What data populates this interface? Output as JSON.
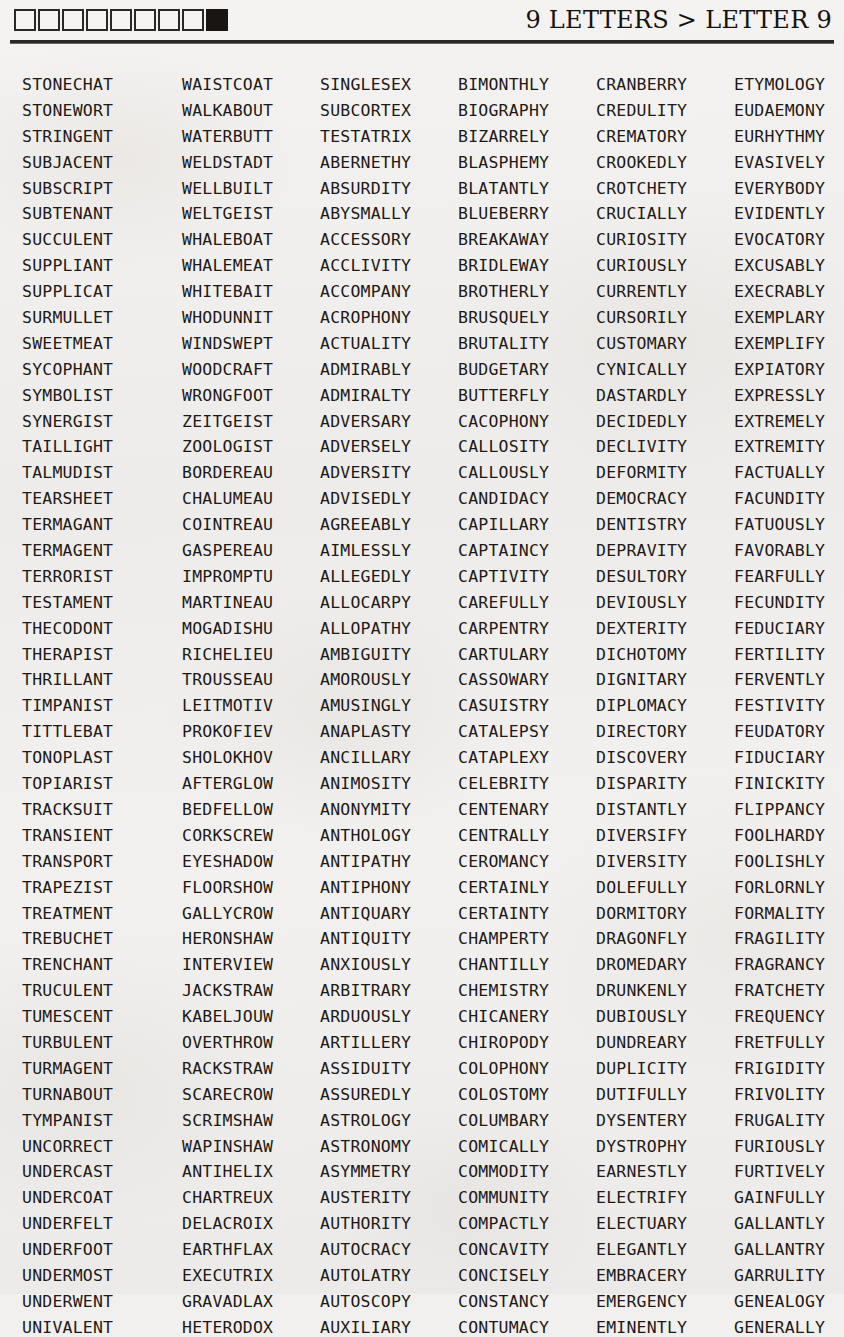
{
  "header": {
    "title": "9 LETTERS > LETTER 9",
    "boxes": [
      {
        "state": "empty"
      },
      {
        "state": "empty"
      },
      {
        "state": "empty"
      },
      {
        "state": "empty"
      },
      {
        "state": "empty"
      },
      {
        "state": "empty"
      },
      {
        "state": "empty"
      },
      {
        "state": "empty"
      },
      {
        "state": "filled"
      }
    ]
  },
  "word_grid": {
    "columns": [
      {
        "index": 1,
        "words": [
          "STONECHAT",
          "STONEWORT",
          "STRINGENT",
          "SUBJACENT",
          "SUBSCRIPT",
          "SUBTENANT",
          "SUCCULENT",
          "SUPPLIANT",
          "SUPPLICAT",
          "SURMULLET",
          "SWEETMEAT",
          "SYCOPHANT",
          "SYMBOLIST",
          "SYNERGIST",
          "TAILLIGHT",
          "TALMUDIST",
          "TEARSHEET",
          "TERMAGANT",
          "TERMAGENT",
          "TERRORIST",
          "TESTAMENT",
          "THECODONT",
          "THERAPIST",
          "THRILLANT",
          "TIMPANIST",
          "TITTLEBAT",
          "TONOPLAST",
          "TOPIARIST",
          "TRACKSUIT",
          "TRANSIENT",
          "TRANSPORT",
          "TRAPEZIST",
          "TREATMENT",
          "TREBUCHET",
          "TRENCHANT",
          "TRUCULENT",
          "TUMESCENT",
          "TURBULENT",
          "TURMAGENT",
          "TURNABOUT",
          "TYMPANIST",
          "UNCORRECT",
          "UNDERCAST",
          "UNDERCOAT",
          "UNDERFELT",
          "UNDERFOOT",
          "UNDERMOST",
          "UNDERWENT",
          "UNIVALENT"
        ]
      },
      {
        "index": 2,
        "words": [
          "WAISTCOAT",
          "WALKABOUT",
          "WATERBUTT",
          "WELDSTADT",
          "WELLBUILT",
          "WELTGEIST",
          "WHALEBOAT",
          "WHALEMEAT",
          "WHITEBAIT",
          "WHODUNNIT",
          "WINDSWEPT",
          "WOODCRAFT",
          "WRONGFOOT",
          "ZEITGEIST",
          "ZOOLOGIST",
          "BORDEREAU",
          "CHALUMEAU",
          "COINTREAU",
          "GASPEREAU",
          "IMPROMPTU",
          "MARTINEAU",
          "MOGADISHU",
          "RICHELIEU",
          "TROUSSEAU",
          "LEITMOTIV",
          "PROKOFIEV",
          "SHOLOKHOV",
          "AFTERGLOW",
          "BEDFELLOW",
          "CORKSCREW",
          "EYESHADOW",
          "FLOORSHOW",
          "GALLYCROW",
          "HERONSHAW",
          "INTERVIEW",
          "JACKSTRAW",
          "KABELJOUW",
          "OVERTHROW",
          "RACKSTRAW",
          "SCARECROW",
          "SCRIMSHAW",
          "WAPINSHAW",
          "ANTIHELIX",
          "CHARTREUX",
          "DELACROIX",
          "EARTHFLAX",
          "EXECUTRIX",
          "GRAVADLAX",
          "HETERODOX"
        ]
      },
      {
        "index": 3,
        "words": [
          "SINGLESEX",
          "SUBCORTEX",
          "TESTATRIX",
          "ABERNETHY",
          "ABSURDITY",
          "ABYSMALLY",
          "ACCESSORY",
          "ACCLIVITY",
          "ACCOMPANY",
          "ACROPHONY",
          "ACTUALITY",
          "ADMIRABLY",
          "ADMIRALTY",
          "ADVERSARY",
          "ADVERSELY",
          "ADVERSITY",
          "ADVISEDLY",
          "AGREEABLY",
          "AIMLESSLY",
          "ALLEGEDLY",
          "ALLOCARPY",
          "ALLOPATHY",
          "AMBIGUITY",
          "AMOROUSLY",
          "AMUSINGLY",
          "ANAPLASTY",
          "ANCILLARY",
          "ANIMOSITY",
          "ANONYMITY",
          "ANTHOLOGY",
          "ANTIPATHY",
          "ANTIPHONY",
          "ANTIQUARY",
          "ANTIQUITY",
          "ANXIOUSLY",
          "ARBITRARY",
          "ARDUOUSLY",
          "ARTILLERY",
          "ASSIDUITY",
          "ASSUREDLY",
          "ASTROLOGY",
          "ASTRONOMY",
          "ASYMMETRY",
          "AUSTERITY",
          "AUTHORITY",
          "AUTOCRACY",
          "AUTOLATRY",
          "AUTOSCOPY",
          "AUXILIARY"
        ]
      },
      {
        "index": 4,
        "words": [
          "BIMONTHLY",
          "BIOGRAPHY",
          "BIZARRELY",
          "BLASPHEMY",
          "BLATANTLY",
          "BLUEBERRY",
          "BREAKAWAY",
          "BRIDLEWAY",
          "BROTHERLY",
          "BRUSQUELY",
          "BRUTALITY",
          "BUDGETARY",
          "BUTTERFLY",
          "CACOPHONY",
          "CALLOSITY",
          "CALLOUSLY",
          "CANDIDACY",
          "CAPILLARY",
          "CAPTAINCY",
          "CAPTIVITY",
          "CAREFULLY",
          "CARPENTRY",
          "CARTULARY",
          "CASSOWARY",
          "CASUISTRY",
          "CATALEPSY",
          "CATAPLEXY",
          "CELEBRITY",
          "CENTENARY",
          "CENTRALLY",
          "CEROMANCY",
          "CERTAINLY",
          "CERTAINTY",
          "CHAMPERTY",
          "CHANTILLY",
          "CHEMISTRY",
          "CHICANERY",
          "CHIROPODY",
          "COLOPHONY",
          "COLOSTOMY",
          "COLUMBARY",
          "COMICALLY",
          "COMMODITY",
          "COMMUNITY",
          "COMPACTLY",
          "CONCAVITY",
          "CONCISELY",
          "CONSTANCY",
          "CONTUMACY"
        ]
      },
      {
        "index": 5,
        "words": [
          "CRANBERRY",
          "CREDULITY",
          "CREMATORY",
          "CROOKEDLY",
          "CROTCHETY",
          "CRUCIALLY",
          "CURIOSITY",
          "CURIOUSLY",
          "CURRENTLY",
          "CURSORILY",
          "CUSTOMARY",
          "CYNICALLY",
          "DASTARDLY",
          "DECIDEDLY",
          "DECLIVITY",
          "DEFORMITY",
          "DEMOCRACY",
          "DENTISTRY",
          "DEPRAVITY",
          "DESULTORY",
          "DEVIOUSLY",
          "DEXTERITY",
          "DICHOTOMY",
          "DIGNITARY",
          "DIPLOMACY",
          "DIRECTORY",
          "DISCOVERY",
          "DISPARITY",
          "DISTANTLY",
          "DIVERSIFY",
          "DIVERSITY",
          "DOLEFULLY",
          "DORMITORY",
          "DRAGONFLY",
          "DROMEDARY",
          "DRUNKENLY",
          "DUBIOUSLY",
          "DUNDREARY",
          "DUPLICITY",
          "DUTIFULLY",
          "DYSENTERY",
          "DYSTROPHY",
          "EARNESTLY",
          "ELECTRIFY",
          "ELECTUARY",
          "ELEGANTLY",
          "EMBRACERY",
          "EMERGENCY",
          "EMINENTLY"
        ]
      },
      {
        "index": 6,
        "words": [
          "ETYMOLOGY",
          "EUDAEMONY",
          "EURHYTHMY",
          "EVASIVELY",
          "EVERYBODY",
          "EVIDENTLY",
          "EVOCATORY",
          "EXCUSABLY",
          "EXECRABLY",
          "EXEMPLARY",
          "EXEMPLIFY",
          "EXPIATORY",
          "EXPRESSLY",
          "EXTREMELY",
          "EXTREMITY",
          "FACTUALLY",
          "FACUNDITY",
          "FATUOUSLY",
          "FAVORABLY",
          "FEARFULLY",
          "FECUNDITY",
          "FEDUCIARY",
          "FERTILITY",
          "FERVENTLY",
          "FESTIVITY",
          "FEUDATORY",
          "FIDUCIARY",
          "FINICKITY",
          "FLIPPANCY",
          "FOOLHARDY",
          "FOOLISHLY",
          "FORLORNLY",
          "FORMALITY",
          "FRAGILITY",
          "FRAGRANCY",
          "FRATCHETY",
          "FREQUENCY",
          "FRETFULLY",
          "FRIGIDITY",
          "FRIVOLITY",
          "FRUGALITY",
          "FURIOUSLY",
          "FURTIVELY",
          "GAINFULLY",
          "GALLANTLY",
          "GALLANTRY",
          "GARRULITY",
          "GENEALOGY",
          "GENERALLY"
        ]
      }
    ]
  },
  "colors": {
    "ink": "#1c1916",
    "paper": "#f2f0ee",
    "rule": "#2b2825",
    "box_filled": "#181513"
  }
}
